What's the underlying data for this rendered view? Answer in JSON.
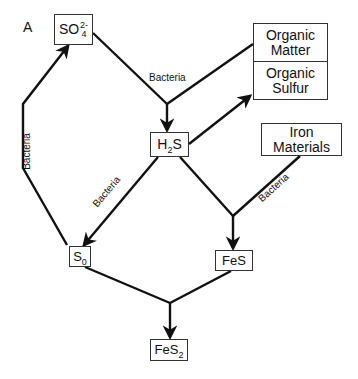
{
  "panel_label": "A",
  "nodes": {
    "sulfate": {
      "base": "SO",
      "sub": "4",
      "sup": "2-"
    },
    "organic_matter": {
      "line1": "Organic",
      "line2": "Matter"
    },
    "organic_sulfur": {
      "line1": "Organic",
      "line2": "Sulfur"
    },
    "h2s": {
      "pre": "H",
      "sub": "2",
      "post": "S"
    },
    "iron_materials": {
      "line1": "Iron",
      "line2": "Materials"
    },
    "s0": {
      "base": "S",
      "sub": "0"
    },
    "fes": {
      "label": "FeS"
    },
    "fes2": {
      "base": "FeS",
      "sub": "2"
    }
  },
  "edge_labels": {
    "sulfate_to_h2s": "Bacteria",
    "s0_to_sulfate": "Bacteria",
    "h2s_to_s0": "Bacteria",
    "iron_to_fes": "Bacteria"
  },
  "colors": {
    "line": "#111111",
    "box_border": "#333333"
  }
}
